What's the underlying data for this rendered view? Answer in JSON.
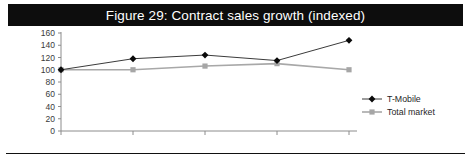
{
  "figure": {
    "title": "Figure 29: Contract sales growth (indexed)",
    "title_band_color": "#0d0d0d",
    "title_text_color": "#ffffff",
    "background_color": "#ffffff",
    "bottom_rule_color": "#111111"
  },
  "legend": {
    "position": "right",
    "entries": [
      {
        "label": "T-Mobile",
        "color": "#0a0a0a",
        "marker": "diamond"
      },
      {
        "label": "Total market",
        "color": "#a6a6a6",
        "marker": "square"
      }
    ]
  },
  "axes": {
    "y_ticks": [
      "160",
      "140",
      "120",
      "100",
      "80",
      "60",
      "40",
      "20",
      "0"
    ],
    "x_ticks": [
      "Q1 2008",
      "Q2 2008",
      "Q3 2008",
      "Q4 2008",
      "Q1 2009"
    ],
    "y_axis_color": "#8c8c8c",
    "x_axis_color": "#8c8c8c"
  },
  "chart_data": {
    "type": "line",
    "title": "Figure 29: Contract sales growth (indexed)",
    "xlabel": "",
    "ylabel": "",
    "categories": [
      "Q1 2008",
      "Q2 2008",
      "Q3 2008",
      "Q4 2008",
      "Q1 2009"
    ],
    "series": [
      {
        "name": "T-Mobile",
        "color": "#0a0a0a",
        "marker": "diamond",
        "values": [
          100,
          118,
          124,
          115,
          148
        ]
      },
      {
        "name": "Total market",
        "color": "#a6a6a6",
        "marker": "square",
        "values": [
          100,
          100,
          106,
          110,
          100
        ]
      }
    ],
    "ylim": [
      0,
      160
    ],
    "ytick_step": 20,
    "grid": false,
    "legend_position": "right"
  }
}
